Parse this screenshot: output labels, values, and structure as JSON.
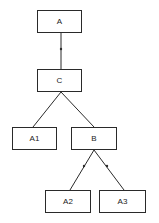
{
  "diagram": {
    "type": "tree",
    "nodes": [
      {
        "id": "A",
        "label": "A",
        "x": 37,
        "y": 10,
        "w": 45,
        "h": 23
      },
      {
        "id": "C",
        "label": "C",
        "x": 37,
        "y": 69,
        "w": 45,
        "h": 23
      },
      {
        "id": "A1",
        "label": "A1",
        "x": 12,
        "y": 127,
        "w": 45,
        "h": 23
      },
      {
        "id": "B",
        "label": "B",
        "x": 71,
        "y": 127,
        "w": 46,
        "h": 23
      },
      {
        "id": "A2",
        "label": "A2",
        "x": 45,
        "y": 190,
        "w": 46,
        "h": 23
      },
      {
        "id": "A3",
        "label": "A3",
        "x": 99,
        "y": 190,
        "w": 47,
        "h": 23
      }
    ],
    "edges": [
      {
        "from": "A",
        "to": "C",
        "marker": "dot"
      },
      {
        "from": "C",
        "to": "A1",
        "marker": "none"
      },
      {
        "from": "C",
        "to": "B",
        "marker": "none"
      },
      {
        "from": "B",
        "to": "A2",
        "marker": "dot"
      },
      {
        "from": "B",
        "to": "A3",
        "marker": "dot"
      }
    ],
    "colors": {
      "line": "#2a2a2a",
      "background": "#ffffff"
    }
  }
}
